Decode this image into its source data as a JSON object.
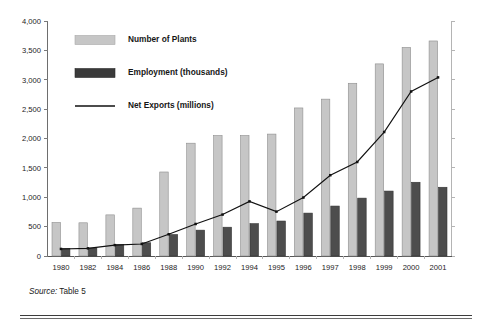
{
  "figure": {
    "source_label": "Source:",
    "source_value": " Table 5"
  },
  "chart_data": {
    "type": "bar",
    "title": "",
    "subtitle": "",
    "xlabel": "",
    "ylabel": "",
    "ylim": [
      0,
      4000
    ],
    "ytick_values": [
      0,
      500,
      1000,
      1500,
      2000,
      2500,
      3000,
      3500,
      4000
    ],
    "ytick_labels": [
      "0",
      "500",
      "1,000",
      "1,500",
      "2,000",
      "2,500",
      "3,000",
      "3,500",
      "4,000"
    ],
    "grid": false,
    "legend_position": "upper-left-inside",
    "categories": [
      "1980",
      "1982",
      "1984",
      "1986",
      "1988",
      "1990",
      "1992",
      "1994",
      "1995",
      "1996",
      "1997",
      "1998",
      "1999",
      "2000",
      "2001"
    ],
    "series": [
      {
        "name": "Number of Plants",
        "kind": "bar",
        "color": "#c6c6c6",
        "values": [
          570,
          565,
          700,
          815,
          1430,
          1920,
          2050,
          2050,
          2075,
          2520,
          2670,
          2940,
          3270,
          3550,
          3660
        ]
      },
      {
        "name": "Employment (thousands)",
        "kind": "bar",
        "color": "#4d4d4d",
        "values": [
          130,
          135,
          195,
          225,
          365,
          440,
          490,
          550,
          595,
          730,
          850,
          985,
          1105,
          1255,
          1170
        ]
      },
      {
        "name": "Net Exports (millions)",
        "kind": "line",
        "color": "#111111",
        "values": [
          120,
          130,
          185,
          205,
          370,
          545,
          705,
          930,
          755,
          995,
          1375,
          1600,
          2110,
          2800,
          3040
        ]
      }
    ]
  }
}
